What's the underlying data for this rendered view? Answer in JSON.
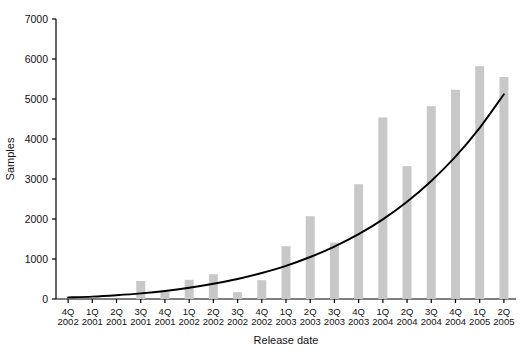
{
  "chart_data": {
    "type": "bar",
    "title": "",
    "subtitle": "",
    "xlabel": "Release date",
    "ylabel": "Samples",
    "ylim": [
      0,
      7000
    ],
    "yticks": [
      0,
      1000,
      2000,
      3000,
      4000,
      5000,
      6000,
      7000
    ],
    "ytick_labels": [
      "0",
      "1000",
      "2000",
      "3000",
      "4000",
      "5000",
      "6000",
      "7000"
    ],
    "grid": false,
    "legend": null,
    "categories": [
      "4Q 2002",
      "1Q 2001",
      "2Q 2001",
      "3Q 2001",
      "4Q 2001",
      "1Q 2002",
      "2Q 2002",
      "3Q 2002",
      "4Q 2002",
      "1Q 2003",
      "2Q 2003",
      "3Q 2003",
      "4Q 2003",
      "1Q 2004",
      "2Q 2004",
      "3Q 2004",
      "4Q 2004",
      "1Q 2005",
      "2Q 2005"
    ],
    "category_lines": [
      [
        "4Q",
        "2002"
      ],
      [
        "1Q",
        "2001"
      ],
      [
        "2Q",
        "2001"
      ],
      [
        "3Q",
        "2001"
      ],
      [
        "4Q",
        "2001"
      ],
      [
        "1Q",
        "2002"
      ],
      [
        "2Q",
        "2002"
      ],
      [
        "3Q",
        "2002"
      ],
      [
        "4Q",
        "2002"
      ],
      [
        "1Q",
        "2003"
      ],
      [
        "2Q",
        "2003"
      ],
      [
        "3Q",
        "2003"
      ],
      [
        "4Q",
        "2003"
      ],
      [
        "1Q",
        "2004"
      ],
      [
        "2Q",
        "2004"
      ],
      [
        "3Q",
        "2004"
      ],
      [
        "4Q",
        "2004"
      ],
      [
        "1Q",
        "2005"
      ],
      [
        "2Q",
        "2005"
      ]
    ],
    "series": [
      {
        "name": "Samples",
        "kind": "bar",
        "color": "#c8c8c8",
        "values": [
          0,
          0,
          0,
          450,
          190,
          480,
          620,
          170,
          470,
          1320,
          2070,
          1410,
          2870,
          4540,
          3320,
          4820,
          5230,
          5820,
          5550
        ]
      },
      {
        "name": "Trend",
        "kind": "line",
        "color": "#000000",
        "values": [
          40,
          60,
          95,
          140,
          200,
          280,
          380,
          500,
          650,
          830,
          1050,
          1310,
          1620,
          1990,
          2430,
          2950,
          3560,
          4280,
          5120
        ]
      }
    ],
    "colors": {
      "bar_fill": "#c8c8c8",
      "line": "#000000",
      "axis": "#000000",
      "text": "#111111",
      "background": "#ffffff"
    }
  }
}
